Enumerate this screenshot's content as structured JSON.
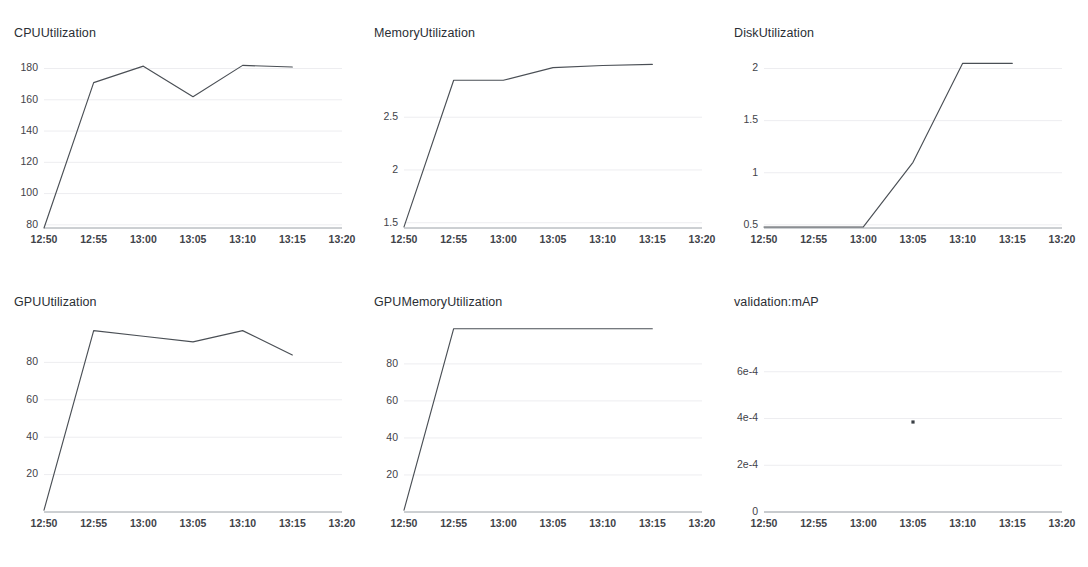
{
  "page": {
    "background": "#ffffff",
    "line_color": "#4a4f55",
    "grid_color": "#ededf0",
    "axis_color": "#9aa0a6",
    "text_color": "#2a2e34"
  },
  "charts": [
    {
      "id": "cpu-utilization",
      "title": "CPUUtilization",
      "type": "line",
      "xlabel": "",
      "ylabel": "",
      "grid": true,
      "legend": "none",
      "x_ticks": [
        "12:50",
        "12:55",
        "13:00",
        "13:05",
        "13:10",
        "13:15",
        "13:20"
      ],
      "y_ticks": [
        "80",
        "100",
        "120",
        "140",
        "160",
        "180"
      ],
      "y_tick_values": [
        80,
        100,
        120,
        140,
        160,
        180
      ],
      "ylim": [
        78,
        188
      ],
      "xlim": [
        "12:50",
        "13:20"
      ],
      "x": [
        "12:50",
        "12:55",
        "13:00",
        "13:05",
        "13:10",
        "13:15"
      ],
      "values": [
        78,
        171,
        181.5,
        162,
        182,
        181
      ]
    },
    {
      "id": "memory-utilization",
      "title": "MemoryUtilization",
      "type": "line",
      "xlabel": "",
      "ylabel": "",
      "grid": true,
      "legend": "none",
      "x_ticks": [
        "12:50",
        "12:55",
        "13:00",
        "13:05",
        "13:10",
        "13:15",
        "13:20"
      ],
      "y_ticks": [
        "1.5",
        "2",
        "2.5"
      ],
      "y_tick_values": [
        1.5,
        2,
        2.5
      ],
      "ylim": [
        1.45,
        3.08
      ],
      "xlim": [
        "12:50",
        "13:20"
      ],
      "x": [
        "12:50",
        "12:55",
        "13:00",
        "13:05",
        "13:10",
        "13:15"
      ],
      "values": [
        1.46,
        2.85,
        2.85,
        2.97,
        2.99,
        3.0
      ]
    },
    {
      "id": "disk-utilization",
      "title": "DiskUtilization",
      "type": "line",
      "xlabel": "",
      "ylabel": "",
      "grid": true,
      "legend": "none",
      "x_ticks": [
        "12:50",
        "12:55",
        "13:00",
        "13:05",
        "13:10",
        "13:15",
        "13:20"
      ],
      "y_ticks": [
        "0.5",
        "1",
        "1.5",
        "2"
      ],
      "y_tick_values": [
        0.5,
        1,
        1.5,
        2
      ],
      "ylim": [
        0.47,
        2.12
      ],
      "xlim": [
        "12:50",
        "13:20"
      ],
      "x": [
        "12:50",
        "12:55",
        "13:00",
        "13:05",
        "13:10",
        "13:15"
      ],
      "values": [
        0.48,
        0.48,
        0.48,
        1.1,
        2.05,
        2.05
      ]
    },
    {
      "id": "gpu-utilization",
      "title": "GPUUtilization",
      "type": "line",
      "xlabel": "",
      "ylabel": "",
      "grid": true,
      "legend": "none",
      "x_ticks": [
        "12:50",
        "12:55",
        "13:00",
        "13:05",
        "13:10",
        "13:15",
        "13:20"
      ],
      "y_ticks": [
        "20",
        "40",
        "60",
        "80"
      ],
      "y_tick_values": [
        20,
        40,
        60,
        80
      ],
      "ylim": [
        0,
        100
      ],
      "xlim": [
        "12:50",
        "13:20"
      ],
      "x": [
        "12:50",
        "12:55",
        "13:00",
        "13:05",
        "13:10",
        "13:15"
      ],
      "values": [
        1,
        97,
        94,
        91,
        97,
        84
      ]
    },
    {
      "id": "gpu-memory-utilization",
      "title": "GPUMemoryUtilization",
      "type": "line",
      "xlabel": "",
      "ylabel": "",
      "grid": true,
      "legend": "none",
      "x_ticks": [
        "12:50",
        "12:55",
        "13:00",
        "13:05",
        "13:10",
        "13:15",
        "13:20"
      ],
      "y_ticks": [
        "20",
        "40",
        "60",
        "80"
      ],
      "y_tick_values": [
        20,
        40,
        60,
        80
      ],
      "ylim": [
        0,
        101
      ],
      "xlim": [
        "12:50",
        "13:20"
      ],
      "x": [
        "12:50",
        "12:55",
        "13:00",
        "13:05",
        "13:10",
        "13:15"
      ],
      "values": [
        1,
        99,
        99,
        99,
        99,
        99
      ]
    },
    {
      "id": "validation-map",
      "title": "validation:mAP",
      "type": "scatter",
      "xlabel": "",
      "ylabel": "",
      "grid": true,
      "legend": "none",
      "x_ticks": [
        "12:50",
        "12:55",
        "13:00",
        "13:05",
        "13:10",
        "13:15",
        "13:20"
      ],
      "y_ticks": [
        "0",
        "2e-4",
        "4e-4",
        "6e-4"
      ],
      "y_tick_values": [
        0,
        0.0002,
        0.0004,
        0.0006
      ],
      "ylim": [
        0,
        0.0008
      ],
      "xlim": [
        "12:50",
        "13:20"
      ],
      "x": [
        "13:05"
      ],
      "values": [
        0.000385
      ]
    }
  ],
  "chart_data": {
    "type": "line",
    "shared_x_ticks": [
      "12:50",
      "12:55",
      "13:00",
      "13:05",
      "13:10",
      "13:15",
      "13:20"
    ],
    "panels": [
      {
        "title": "CPUUtilization",
        "type": "line",
        "x": [
          "12:50",
          "12:55",
          "13:00",
          "13:05",
          "13:10",
          "13:15"
        ],
        "values": [
          78,
          171,
          181.5,
          162,
          182,
          181
        ],
        "ylim": [
          78,
          188
        ],
        "ytick_labels": [
          "80",
          "100",
          "120",
          "140",
          "160",
          "180"
        ]
      },
      {
        "title": "MemoryUtilization",
        "type": "line",
        "x": [
          "12:50",
          "12:55",
          "13:00",
          "13:05",
          "13:10",
          "13:15"
        ],
        "values": [
          1.46,
          2.85,
          2.85,
          2.97,
          2.99,
          3.0
        ],
        "ylim": [
          1.45,
          3.08
        ],
        "ytick_labels": [
          "1.5",
          "2",
          "2.5"
        ]
      },
      {
        "title": "DiskUtilization",
        "type": "line",
        "x": [
          "12:50",
          "12:55",
          "13:00",
          "13:05",
          "13:10",
          "13:15"
        ],
        "values": [
          0.48,
          0.48,
          0.48,
          1.1,
          2.05,
          2.05
        ],
        "ylim": [
          0.47,
          2.12
        ],
        "ytick_labels": [
          "0.5",
          "1",
          "1.5",
          "2"
        ]
      },
      {
        "title": "GPUUtilization",
        "type": "line",
        "x": [
          "12:50",
          "12:55",
          "13:00",
          "13:05",
          "13:10",
          "13:15"
        ],
        "values": [
          1,
          97,
          94,
          91,
          97,
          84
        ],
        "ylim": [
          0,
          100
        ],
        "ytick_labels": [
          "20",
          "40",
          "60",
          "80"
        ]
      },
      {
        "title": "GPUMemoryUtilization",
        "type": "line",
        "x": [
          "12:50",
          "12:55",
          "13:00",
          "13:05",
          "13:10",
          "13:15"
        ],
        "values": [
          1,
          99,
          99,
          99,
          99,
          99
        ],
        "ylim": [
          0,
          101
        ],
        "ytick_labels": [
          "20",
          "40",
          "60",
          "80"
        ]
      },
      {
        "title": "validation:mAP",
        "type": "scatter",
        "x": [
          "13:05"
        ],
        "values": [
          0.000385
        ],
        "ylim": [
          0,
          0.0008
        ],
        "ytick_labels": [
          "0",
          "2e-4",
          "4e-4",
          "6e-4"
        ]
      }
    ]
  }
}
